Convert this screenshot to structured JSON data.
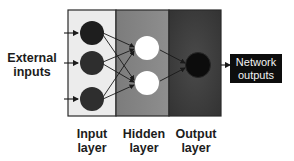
{
  "diagram": {
    "external_inputs_label": "External inputs",
    "network_outputs_label": "Network outputs",
    "layers": [
      {
        "name": "Input layer",
        "label_line1": "Input",
        "label_line2": "layer",
        "nodes": 3,
        "background": "#eaeaea",
        "node_color": "#2b2b2b"
      },
      {
        "name": "Hidden layer",
        "label_line1": "Hidden",
        "label_line2": "layer",
        "nodes": 2,
        "background": "#8a8a8a",
        "node_color": "#ffffff"
      },
      {
        "name": "Output layer",
        "label_line1": "Output",
        "label_line2": "layer",
        "nodes": 1,
        "background": "#3e3e3e",
        "node_color": "#0e0e0e"
      }
    ],
    "connections": "fully connected input→hidden→output"
  }
}
